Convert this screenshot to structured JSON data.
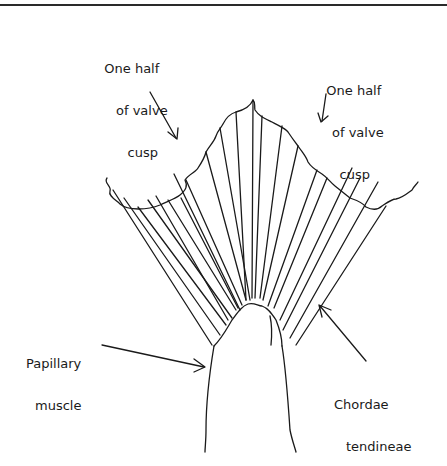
{
  "figure": {
    "type": "anatomical line drawing",
    "line_color": "#1a1a1a",
    "background": "#ffffff"
  },
  "labels": {
    "left_cusp": {
      "lines": [
        "One half",
        "of valve",
        "cusp"
      ]
    },
    "right_cusp": {
      "lines": [
        "One half",
        "of valve",
        "cusp"
      ]
    },
    "papillary": {
      "lines": [
        "Papillary",
        "muscle"
      ]
    },
    "chordae": {
      "lines": [
        "Chordae",
        "tendineae"
      ]
    }
  }
}
